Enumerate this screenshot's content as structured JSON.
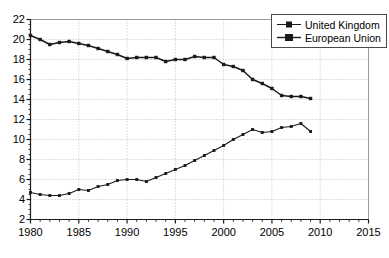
{
  "chart_data": {
    "type": "line",
    "title": "",
    "xlabel": "",
    "ylabel": "",
    "xlim": [
      1980,
      2015
    ],
    "ylim": [
      2,
      22
    ],
    "xticks": [
      1980,
      1985,
      1990,
      1995,
      2000,
      2005,
      2010,
      2015
    ],
    "yticks": [
      2,
      4,
      6,
      8,
      10,
      12,
      14,
      16,
      18,
      20,
      22
    ],
    "xtick_labels": [
      "1980",
      "1985",
      "1990",
      "1995",
      "2000",
      "2005",
      "2010",
      "2015"
    ],
    "ytick_labels": [
      "2",
      "4",
      "6",
      "8",
      "10",
      "12",
      "14",
      "16",
      "18",
      "20",
      "22"
    ],
    "grid": true,
    "grid_style": "dotted",
    "grid_color": "#bdbdbd",
    "minor_ticks": true,
    "minor_tick_interval_x": 1,
    "minor_tick_interval_y": 0.5,
    "legend_position": "top-right",
    "line_color": "#1a1a1a",
    "marker": "square",
    "x": [
      1980,
      1981,
      1982,
      1983,
      1984,
      1985,
      1986,
      1987,
      1988,
      1989,
      1990,
      1991,
      1992,
      1993,
      1994,
      1995,
      1996,
      1997,
      1998,
      1999,
      2000,
      2001,
      2002,
      2003,
      2004,
      2005,
      2006,
      2007,
      2008,
      2009
    ],
    "series": [
      {
        "name": "United Kingdom",
        "marker": "square",
        "color": "#1a1a1a",
        "values": [
          4.7,
          4.5,
          4.4,
          4.4,
          4.6,
          5.0,
          4.9,
          5.3,
          5.5,
          5.9,
          6.0,
          6.0,
          5.8,
          6.2,
          6.6,
          7.0,
          7.4,
          7.9,
          8.4,
          8.9,
          9.4,
          10.0,
          10.5,
          11.0,
          10.7,
          10.8,
          11.2,
          11.3,
          11.6,
          10.8
        ]
      },
      {
        "name": "European Union",
        "marker": "square",
        "color": "#1a1a1a",
        "values": [
          20.4,
          20.0,
          19.5,
          19.7,
          19.8,
          19.6,
          19.4,
          19.1,
          18.8,
          18.5,
          18.1,
          18.2,
          18.2,
          18.2,
          17.8,
          18.0,
          18.0,
          18.3,
          18.2,
          18.2,
          17.5,
          17.3,
          16.9,
          16.0,
          15.6,
          15.1,
          14.4,
          14.3,
          14.3,
          14.1
        ]
      }
    ]
  },
  "legend": {
    "items": [
      {
        "label": "United Kingdom"
      },
      {
        "label": "European Union"
      }
    ]
  }
}
